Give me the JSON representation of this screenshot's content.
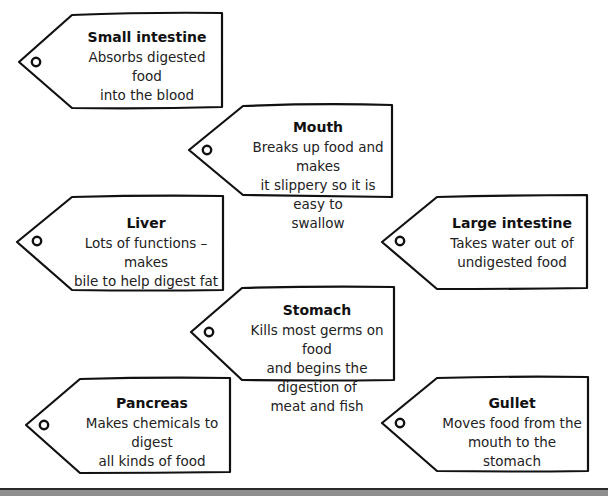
{
  "document": {
    "type": "worksheet",
    "topic": "digestive system organ labels"
  },
  "tags": [
    {
      "id": "small-intestine",
      "title": "Small intestine",
      "description": "Absorbs digested food\ninto the blood",
      "point": [
        19,
        62
      ],
      "left_x": 72,
      "right_x": 222,
      "top_y": 14,
      "bottom_y": 108
    },
    {
      "id": "mouth",
      "title": "Mouth",
      "description": "Breaks up food and makes\nit slippery so it is easy to\nswallow",
      "point": [
        189,
        150
      ],
      "left_x": 243,
      "right_x": 392,
      "top_y": 105,
      "bottom_y": 196
    },
    {
      "id": "liver",
      "title": "Liver",
      "description": "Lots of functions – makes\nbile to help digest fat",
      "point": [
        17,
        242
      ],
      "left_x": 72,
      "right_x": 223,
      "top_y": 196,
      "bottom_y": 290
    },
    {
      "id": "large-intestine",
      "title": "Large intestine",
      "description": "Takes water out of\nundigested food",
      "point": [
        382,
        242
      ],
      "left_x": 437,
      "right_x": 587,
      "top_y": 195,
      "bottom_y": 288
    },
    {
      "id": "stomach",
      "title": "Stomach",
      "description": "Kills most germs on food\nand begins the digestion of\nmeat and fish",
      "point": [
        191,
        332
      ],
      "left_x": 242,
      "right_x": 394,
      "top_y": 287,
      "bottom_y": 380
    },
    {
      "id": "pancreas",
      "title": "Pancreas",
      "description": "Makes chemicals to digest\nall kinds of food",
      "point": [
        26,
        425
      ],
      "left_x": 80,
      "right_x": 230,
      "top_y": 378,
      "bottom_y": 473
    },
    {
      "id": "gullet",
      "title": "Gullet",
      "description": "Moves food from the\nmouth to the stomach",
      "point": [
        382,
        423
      ],
      "left_x": 437,
      "right_x": 588,
      "top_y": 377,
      "bottom_y": 471
    }
  ],
  "colors": {
    "outline": "#111111",
    "text": "#222222",
    "background": "#ffffff",
    "bottom_bar": "#8f8f8f"
  }
}
